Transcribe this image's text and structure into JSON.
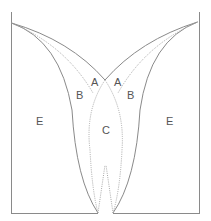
{
  "diagram": {
    "labels": {
      "a_left": "A",
      "a_right": "A",
      "b_left": "B",
      "b_right": "B",
      "c_center": "C",
      "e_left": "E",
      "e_right": "E"
    },
    "colors": {
      "solid_line": "#8a8a8a",
      "dotted_line": "#a8a8a8",
      "label": "#555555"
    }
  }
}
